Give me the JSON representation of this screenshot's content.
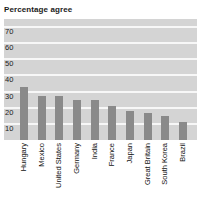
{
  "chart_data": {
    "type": "bar",
    "title": "Percentage agree",
    "xlabel": "",
    "ylabel": "",
    "ylim": [
      0,
      75
    ],
    "grid": true,
    "legend": "none",
    "yticks": [
      70,
      60,
      50,
      40,
      30,
      20,
      10
    ],
    "categories": [
      "Hungary",
      "Mexico",
      "United States",
      "Germany",
      "India",
      "France",
      "Japan",
      "Great Britain",
      "South Korea",
      "Brazil"
    ],
    "values": [
      33,
      27,
      27,
      25,
      25,
      21,
      18,
      17,
      15,
      11
    ],
    "bar_color": "#8a8a8a",
    "plot_background": "#d4d4d4",
    "gridline_color": "#f7f7f7"
  }
}
